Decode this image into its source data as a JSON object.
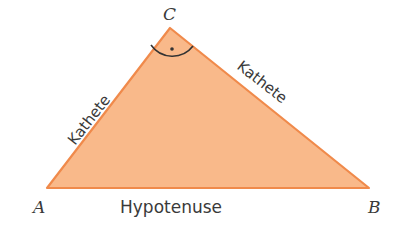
{
  "diagram": {
    "type": "right-triangle",
    "colors": {
      "fill": "#f9b98a",
      "stroke": "#f08a4b",
      "text": "#3a3a3a"
    },
    "vertices": {
      "A": "A",
      "B": "B",
      "C": "C"
    },
    "sides": {
      "left_leg": "Kathete",
      "right_leg": "Kathete",
      "base": "Hypotenuse"
    },
    "right_angle_at": "C"
  }
}
